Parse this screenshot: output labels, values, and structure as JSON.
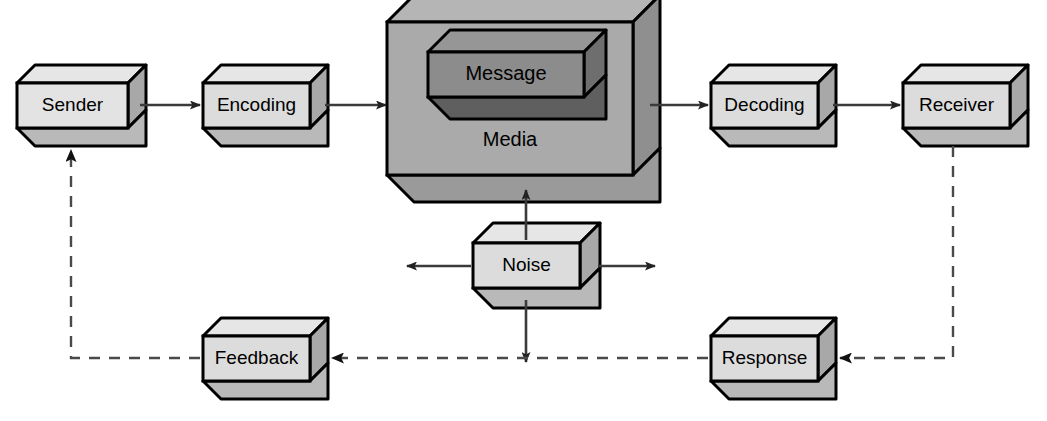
{
  "diagram": {
    "type": "process-flow-diagram",
    "style": "isometric-3d-blocks",
    "colors": {
      "box_front": "#dcdcdc",
      "box_side": "#a8a8a8",
      "box_bottom": "#b4b4b4",
      "media_front": "#a9a9a9",
      "media_side": "#8a8a8a",
      "media_bottom": "#919191",
      "message_front": "#8c8c8c",
      "message_side": "#6e6e6e",
      "message_bottom": "#5f5f5f",
      "outline": "#000000",
      "arrow": "#3a3a3a",
      "dashed": "#4a4a4a",
      "background": "#ffffff"
    },
    "nodes": [
      {
        "id": "sender",
        "label": "Sender",
        "x": 17,
        "y": 83,
        "w": 111,
        "h": 45,
        "depth": 18,
        "shade": "light"
      },
      {
        "id": "encoding",
        "label": "Encoding",
        "x": 203,
        "y": 83,
        "w": 107,
        "h": 45,
        "depth": 18,
        "shade": "light"
      },
      {
        "id": "media",
        "label": "Media",
        "x": 387,
        "y": 22,
        "w": 246,
        "h": 153,
        "depth": 27,
        "shade": "media"
      },
      {
        "id": "message",
        "label": "Message",
        "x": 428,
        "y": 52,
        "w": 156,
        "h": 45,
        "depth": 22,
        "shade": "dark"
      },
      {
        "id": "decoding",
        "label": "Decoding",
        "x": 711,
        "y": 83,
        "w": 107,
        "h": 45,
        "depth": 18,
        "shade": "light"
      },
      {
        "id": "receiver",
        "label": "Receiver",
        "x": 903,
        "y": 83,
        "w": 107,
        "h": 45,
        "depth": 18,
        "shade": "light"
      },
      {
        "id": "noise",
        "label": "Noise",
        "x": 473,
        "y": 243,
        "w": 107,
        "h": 45,
        "depth": 20,
        "shade": "light"
      },
      {
        "id": "feedback",
        "label": "Feedback",
        "x": 203,
        "y": 336,
        "w": 107,
        "h": 45,
        "depth": 18,
        "shade": "light"
      },
      {
        "id": "response",
        "label": "Response",
        "x": 711,
        "y": 336,
        "w": 107,
        "h": 45,
        "depth": 18,
        "shade": "light"
      }
    ],
    "connections": [
      {
        "id": "sender-to-encoding",
        "from": "Sender",
        "to": "Encoding",
        "style": "solid",
        "direction": "right"
      },
      {
        "id": "encoding-to-media",
        "from": "Encoding",
        "to": "Media",
        "style": "solid",
        "direction": "right"
      },
      {
        "id": "media-to-decoding",
        "from": "Media",
        "to": "Decoding",
        "style": "solid",
        "direction": "right"
      },
      {
        "id": "decoding-to-receiver",
        "from": "Decoding",
        "to": "Receiver",
        "style": "solid",
        "direction": "right"
      },
      {
        "id": "noise-to-media",
        "from": "Noise",
        "to": "Media",
        "style": "solid",
        "direction": "up"
      },
      {
        "id": "noise-to-left",
        "from": "Noise",
        "to": "",
        "style": "solid",
        "direction": "left"
      },
      {
        "id": "noise-to-right",
        "from": "Noise",
        "to": "",
        "style": "solid",
        "direction": "right"
      },
      {
        "id": "noise-to-down",
        "from": "Noise",
        "to": "",
        "style": "solid",
        "direction": "down"
      },
      {
        "id": "receiver-to-response",
        "from": "Receiver",
        "to": "Response",
        "style": "dashed",
        "direction": "left"
      },
      {
        "id": "response-to-feedback",
        "from": "Response",
        "to": "Feedback",
        "style": "dashed",
        "direction": "left"
      },
      {
        "id": "feedback-to-sender",
        "from": "Feedback",
        "to": "Sender",
        "style": "dashed",
        "direction": "up"
      }
    ],
    "labels": {
      "sender": "Sender",
      "encoding": "Encoding",
      "message": "Message",
      "media": "Media",
      "decoding": "Decoding",
      "receiver": "Receiver",
      "noise": "Noise",
      "feedback": "Feedback",
      "response": "Response"
    }
  }
}
